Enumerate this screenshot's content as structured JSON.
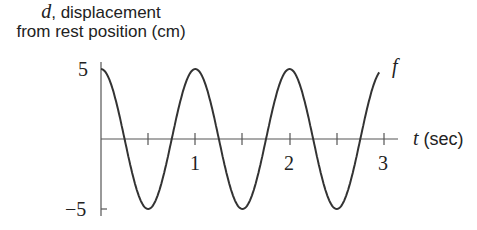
{
  "chart_data": {
    "type": "line",
    "title": "",
    "ylabel_var": "d",
    "ylabel_line1_rest": ", displacement",
    "ylabel_line2": "from rest position (cm)",
    "xlabel_var": "t",
    "xlabel_unit": "(sec)",
    "series": [
      {
        "name": "f",
        "function": "d = 5cos(2πt)",
        "x": [
          0,
          0.25,
          0.5,
          0.75,
          1,
          1.25,
          1.5,
          1.75,
          2,
          2.25,
          2.5,
          2.75,
          2.95
        ],
        "values": [
          5,
          0,
          -5,
          0,
          5,
          0,
          -5,
          0,
          5,
          0,
          -5,
          0,
          4.76
        ]
      }
    ],
    "xticks": [
      "1",
      "2",
      "3"
    ],
    "yticks": [
      "5",
      "−5"
    ],
    "xlim": [
      0,
      3
    ],
    "ylim": [
      -5,
      5
    ],
    "curve_label": "f",
    "grid": false
  }
}
